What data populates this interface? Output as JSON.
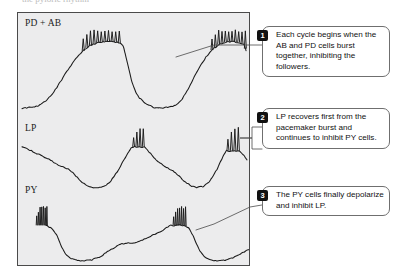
{
  "figure": {
    "panel_background": "#ececed",
    "panel_border": "#4a4a4a",
    "trace_color": "#1a1a1a",
    "badge_color": "#111111",
    "callout_border": "#6f6f6f",
    "cropped_header_text": "the pyloric rhythm"
  },
  "traces": {
    "labels": [
      {
        "id": "pdab",
        "text": "PD + AB"
      },
      {
        "id": "lp",
        "text": "LP"
      },
      {
        "id": "py",
        "text": "PY"
      }
    ]
  },
  "callouts": [
    {
      "number": "1",
      "text": "Each cycle begins when the AB and PD cells burst together, inhibiting the followers."
    },
    {
      "number": "2",
      "text": "LP recovers first from the pacemaker burst and continues to inhibit PY cells."
    },
    {
      "number": "3",
      "text": "The PY cells finally depolarize and inhibit LP."
    }
  ],
  "chart_data": {
    "type": "line",
    "title": "",
    "xlabel": "",
    "ylabel": "",
    "grid": false,
    "legend_position": "inline-left-labels",
    "x_range": [
      0,
      233
    ],
    "series": [
      {
        "name": "PD + AB",
        "row_top": 18,
        "row_baseline": 96,
        "slow_wave": [
          [
            4,
            96
          ],
          [
            14,
            95
          ],
          [
            22,
            93
          ],
          [
            30,
            87
          ],
          [
            38,
            77
          ],
          [
            46,
            64
          ],
          [
            54,
            52
          ],
          [
            60,
            44
          ],
          [
            66,
            38
          ],
          [
            72,
            33
          ],
          [
            80,
            30
          ],
          [
            88,
            29
          ],
          [
            96,
            29
          ],
          [
            102,
            30
          ],
          [
            106,
            33
          ],
          [
            109,
            44
          ],
          [
            112,
            58
          ],
          [
            116,
            73
          ],
          [
            121,
            84
          ],
          [
            128,
            91
          ],
          [
            136,
            95
          ],
          [
            143,
            96
          ],
          [
            150,
            95
          ],
          [
            155,
            94
          ],
          [
            160,
            92
          ],
          [
            166,
            86
          ],
          [
            172,
            76
          ],
          [
            178,
            64
          ],
          [
            184,
            53
          ],
          [
            190,
            44
          ],
          [
            196,
            37
          ],
          [
            202,
            32
          ],
          [
            210,
            29
          ],
          [
            218,
            29
          ],
          [
            224,
            30
          ],
          [
            228,
            32
          ],
          [
            230,
            38
          ]
        ],
        "burst_windows": [
          {
            "start": 64,
            "end": 104,
            "spike_count": 11,
            "peak_y": 18,
            "base_y": 34
          },
          {
            "start": 194,
            "end": 231,
            "spike_count": 11,
            "peak_y": 18,
            "base_y": 34
          }
        ],
        "burst_phase_note": "pacemaker burst at the peak of the depolarized plateau"
      },
      {
        "name": "LP",
        "row_top": 116,
        "row_baseline": 174,
        "slow_wave": [
          [
            4,
            135
          ],
          [
            12,
            138
          ],
          [
            20,
            142
          ],
          [
            28,
            146
          ],
          [
            34,
            149
          ],
          [
            40,
            153
          ],
          [
            46,
            155
          ],
          [
            52,
            158
          ],
          [
            58,
            164
          ],
          [
            64,
            170
          ],
          [
            70,
            174
          ],
          [
            76,
            176
          ],
          [
            82,
            176
          ],
          [
            88,
            174
          ],
          [
            94,
            169
          ],
          [
            100,
            160
          ],
          [
            106,
            150
          ],
          [
            111,
            141
          ],
          [
            115,
            135
          ],
          [
            128,
            135
          ],
          [
            133,
            141
          ],
          [
            138,
            147
          ],
          [
            144,
            152
          ],
          [
            150,
            156
          ],
          [
            156,
            159
          ],
          [
            162,
            164
          ],
          [
            168,
            170
          ],
          [
            174,
            174
          ],
          [
            180,
            176
          ],
          [
            186,
            175
          ],
          [
            192,
            171
          ],
          [
            197,
            164
          ],
          [
            202,
            155
          ],
          [
            206,
            146
          ],
          [
            210,
            139
          ],
          [
            224,
            139
          ],
          [
            228,
            144
          ],
          [
            231,
            148
          ]
        ],
        "burst_windows": [
          {
            "start": 115,
            "end": 128,
            "spike_count": 4,
            "peak_y": 116,
            "base_y": 136
          },
          {
            "start": 210,
            "end": 224,
            "spike_count": 4,
            "peak_y": 116,
            "base_y": 140
          }
        ],
        "burst_phase_note": "LP burst follows the pacemaker burst"
      },
      {
        "name": "PY",
        "row_top": 196,
        "row_baseline": 248,
        "slow_wave": [
          [
            28,
            214
          ],
          [
            32,
            216
          ],
          [
            36,
            219
          ],
          [
            40,
            226
          ],
          [
            44,
            236
          ],
          [
            48,
            243
          ],
          [
            52,
            247
          ],
          [
            58,
            249
          ],
          [
            66,
            250
          ],
          [
            74,
            249
          ],
          [
            82,
            246
          ],
          [
            90,
            241
          ],
          [
            98,
            236
          ],
          [
            104,
            233
          ],
          [
            110,
            232
          ],
          [
            116,
            232
          ],
          [
            122,
            230
          ],
          [
            128,
            228
          ],
          [
            134,
            225
          ],
          [
            140,
            222
          ],
          [
            146,
            219
          ],
          [
            150,
            216
          ],
          [
            154,
            214
          ],
          [
            168,
            214
          ],
          [
            172,
            217
          ],
          [
            176,
            223
          ],
          [
            180,
            233
          ],
          [
            184,
            241
          ],
          [
            188,
            246
          ],
          [
            194,
            249
          ],
          [
            202,
            250
          ],
          [
            210,
            249
          ],
          [
            218,
            246
          ],
          [
            224,
            243
          ],
          [
            230,
            240
          ],
          [
            236,
            237
          ],
          [
            240,
            235
          ]
        ],
        "burst_windows": [
          {
            "start": 18,
            "end": 30,
            "spike_count": 7,
            "peak_y": 196,
            "base_y": 215
          },
          {
            "start": 156,
            "end": 170,
            "spike_count": 7,
            "peak_y": 196,
            "base_y": 215
          }
        ],
        "burst_phase_note": "PY burst terminates the cycle"
      }
    ],
    "leaders": [
      {
        "from_callout": "1",
        "points": [
          [
            262,
            45
          ],
          [
            214,
            45
          ],
          [
            176,
            57
          ]
        ]
      },
      {
        "from_callout": "2",
        "points": [
          [
            262,
            127
          ],
          [
            252,
            127
          ],
          [
            252,
            138
          ],
          [
            240,
            138
          ],
          [
            252,
            138
          ],
          [
            252,
            149
          ],
          [
            262,
            149
          ]
        ]
      },
      {
        "from_callout": "3",
        "points": [
          [
            262,
            205
          ],
          [
            250,
            207
          ],
          [
            214,
            224
          ],
          [
            196,
            230
          ]
        ]
      }
    ]
  }
}
